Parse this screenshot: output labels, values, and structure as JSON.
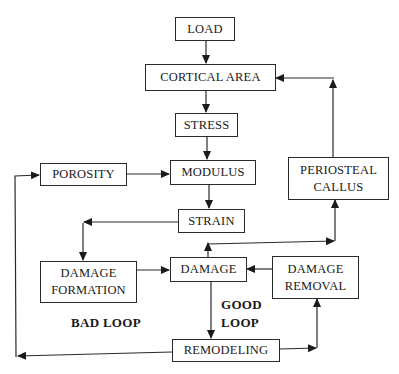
{
  "diagram": {
    "type": "flowchart",
    "nodes": {
      "load": "LOAD",
      "cortical_area": "CORTICAL AREA",
      "stress": "STRESS",
      "modulus": "MODULUS",
      "porosity": "POROSITY",
      "periosteal_callus": "PERIOSTEAL\nCALLUS",
      "strain": "STRAIN",
      "damage_formation": "DAMAGE\nFORMATION",
      "damage": "DAMAGE",
      "damage_removal": "DAMAGE\nREMOVAL",
      "remodeling": "REMODELING"
    },
    "labels": {
      "bad_loop": "BAD LOOP",
      "good_loop": "GOOD\nLOOP"
    },
    "edges": [
      {
        "from": "LOAD",
        "to": "CORTICAL AREA"
      },
      {
        "from": "CORTICAL AREA",
        "to": "STRESS"
      },
      {
        "from": "STRESS",
        "to": "MODULUS"
      },
      {
        "from": "POROSITY",
        "to": "MODULUS"
      },
      {
        "from": "MODULUS",
        "to": "STRAIN"
      },
      {
        "from": "STRAIN",
        "to": "DAMAGE FORMATION"
      },
      {
        "from": "DAMAGE FORMATION",
        "to": "DAMAGE"
      },
      {
        "from": "DAMAGE",
        "to": "REMODELING"
      },
      {
        "from": "DAMAGE",
        "to": "PERIOSTEAL CALLUS"
      },
      {
        "from": "PERIOSTEAL CALLUS",
        "to": "CORTICAL AREA"
      },
      {
        "from": "DAMAGE REMOVAL",
        "to": "DAMAGE"
      },
      {
        "from": "REMODELING",
        "to": "DAMAGE REMOVAL"
      },
      {
        "from": "REMODELING",
        "to": "POROSITY"
      }
    ],
    "colors": {
      "line": "#2a2a2a",
      "background": "#ffffff"
    }
  }
}
